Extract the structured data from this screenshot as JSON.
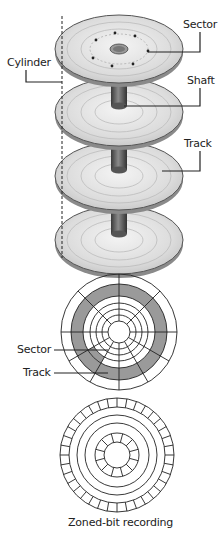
{
  "platter_stack": {
    "labels": {
      "sector": "Sector",
      "cylinder": "Cylinder",
      "shaft": "Shaft",
      "track": "Track"
    },
    "platter_count": 4
  },
  "track_sector_diagram": {
    "labels": {
      "sector": "Sector",
      "track": "Track"
    },
    "highlight_color": "#9a9a9a"
  },
  "zoned_bit_diagram": {
    "caption": "Zoned-bit recording"
  },
  "colors": {
    "line": "#222222",
    "platter_fill": "#dedede",
    "platter_edge": "#555555",
    "shaft": "#666666"
  }
}
